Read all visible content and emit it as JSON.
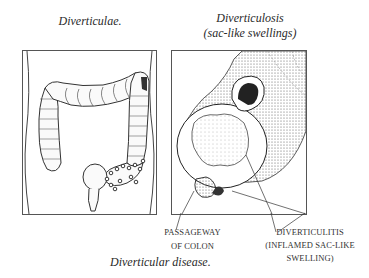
{
  "left_panel": {
    "title": "Diverticulae.",
    "illustration": "large-intestine-with-diverticula"
  },
  "right_panel": {
    "title_line1": "Diverticulosis",
    "title_line2": "(sac-like swellings)",
    "illustration": "colon-cross-section",
    "labels": {
      "passageway_line1": "PASSAGEWAY",
      "passageway_line2": "OF COLON",
      "diverticulitis_line1": "DIVERTICULITIS",
      "diverticulitis_line2": "(INFLAMED SAC-LIKE",
      "diverticulitis_line3": "SWELLING)"
    }
  },
  "caption": "Diverticular disease."
}
